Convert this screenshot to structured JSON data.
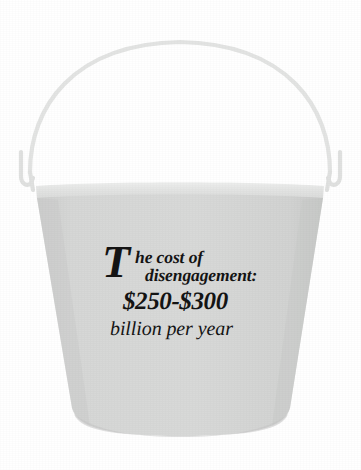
{
  "image": {
    "subject": "bucket",
    "alt_title": "Gray pail with caption about the cost of disengagement",
    "background_color": "#ffffff"
  },
  "bucket": {
    "body_color": "#d4d5d4",
    "body_shade_color": "#c9cac9",
    "rim_color": "#e2e3e2",
    "handle_color": "#e6e7e6",
    "hook_color": "#e0e1e0",
    "outline_color": "#cfd0cf",
    "parts": {
      "handle_label": "bucket-handle",
      "rim_label": "bucket-rim",
      "body_label": "bucket-body",
      "left_hook_label": "left-handle-hook",
      "right_hook_label": "right-handle-hook"
    }
  },
  "caption": {
    "dropcap": "T",
    "line_1": "he cost of",
    "line_2": "disengagement:",
    "line_3": "$250-$300",
    "line_4": "billion per year",
    "text_color": "#141414",
    "full_text": "The cost of disengagement: $250-$300 billion per year"
  }
}
